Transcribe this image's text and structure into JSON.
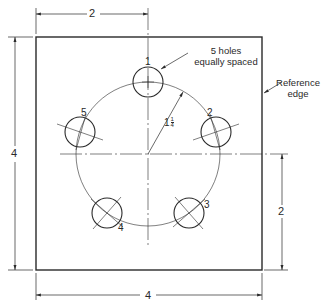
{
  "drawing": {
    "plate": {
      "width_label": "4",
      "height_label": "4"
    },
    "dimensions": {
      "top_offset": "2",
      "left_height": "4",
      "right_offset": "2",
      "bottom_width": "4"
    },
    "bolt_circle": {
      "radius_label_whole": "1",
      "radius_label_num": "1",
      "radius_label_den": "4"
    },
    "holes": [
      {
        "id": "1",
        "label": "1"
      },
      {
        "id": "2",
        "label": "2"
      },
      {
        "id": "3",
        "label": "3"
      },
      {
        "id": "4",
        "label": "4"
      },
      {
        "id": "5",
        "label": "5"
      }
    ],
    "notes": {
      "holes_note_line1": "5 holes",
      "holes_note_line2": "equally spaced",
      "reference_line1": "Reference",
      "reference_line2": "edge"
    },
    "colors": {
      "line": "#2a2a2a",
      "background": "#ffffff"
    }
  }
}
